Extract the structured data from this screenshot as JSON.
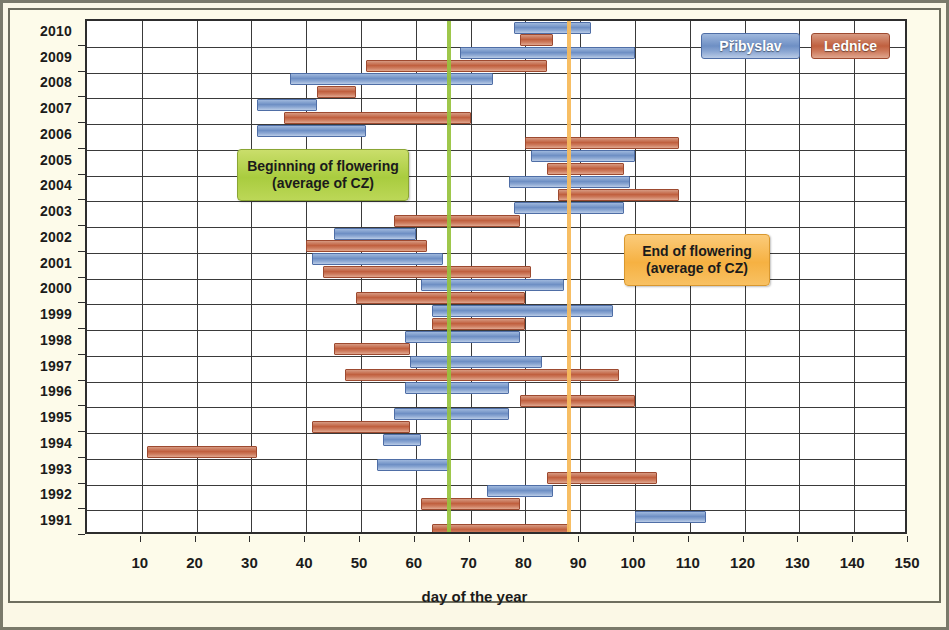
{
  "chart_data": {
    "type": "bar",
    "orientation": "horizontal",
    "subtype": "range-bars",
    "title": "",
    "xlabel": "day of the year",
    "ylabel": "",
    "xlim": [
      0,
      150
    ],
    "ylim_categories": [
      "1991",
      "1992",
      "1993",
      "1994",
      "1995",
      "1996",
      "1997",
      "1998",
      "1999",
      "2000",
      "2001",
      "2002",
      "2003",
      "2004",
      "2005",
      "2006",
      "2007",
      "2008",
      "2009",
      "2010"
    ],
    "grid": true,
    "legend_position": "top-right",
    "x_ticks": [
      10,
      20,
      30,
      40,
      50,
      60,
      70,
      80,
      90,
      100,
      110,
      120,
      130,
      140,
      150
    ],
    "categories": [
      "2010",
      "2009",
      "2008",
      "2007",
      "2006",
      "2005",
      "2004",
      "2003",
      "2002",
      "2001",
      "2000",
      "1999",
      "1998",
      "1997",
      "1996",
      "1995",
      "1994",
      "1993",
      "1992",
      "1991"
    ],
    "series": [
      {
        "name": "Přibyslav",
        "color": "#6e8fc4",
        "ranges": [
          {
            "year": "2010",
            "start": 78,
            "end": 92
          },
          {
            "year": "2009",
            "start": 68,
            "end": 100
          },
          {
            "year": "2008",
            "start": 37,
            "end": 74
          },
          {
            "year": "2007",
            "start": 31,
            "end": 42
          },
          {
            "year": "2006",
            "start": 31,
            "end": 51
          },
          {
            "year": "2005",
            "start": 81,
            "end": 100
          },
          {
            "year": "2004",
            "start": 77,
            "end": 99
          },
          {
            "year": "2003",
            "start": 78,
            "end": 98
          },
          {
            "year": "2002",
            "start": 45,
            "end": 60
          },
          {
            "year": "2001",
            "start": 41,
            "end": 65
          },
          {
            "year": "2000",
            "start": 61,
            "end": 87
          },
          {
            "year": "1999",
            "start": 63,
            "end": 96
          },
          {
            "year": "1998",
            "start": 58,
            "end": 79
          },
          {
            "year": "1997",
            "start": 59,
            "end": 83
          },
          {
            "year": "1996",
            "start": 58,
            "end": 77
          },
          {
            "year": "1995",
            "start": 56,
            "end": 77
          },
          {
            "year": "1994",
            "start": 54,
            "end": 61
          },
          {
            "year": "1993",
            "start": 53,
            "end": 66
          },
          {
            "year": "1992",
            "start": 73,
            "end": 85
          },
          {
            "year": "1991",
            "start": 100,
            "end": 113
          }
        ]
      },
      {
        "name": "Lednice",
        "color": "#c0603f",
        "ranges": [
          {
            "year": "2010",
            "start": 79,
            "end": 85
          },
          {
            "year": "2009",
            "start": 51,
            "end": 84
          },
          {
            "year": "2008",
            "start": 42,
            "end": 49
          },
          {
            "year": "2007",
            "start": 36,
            "end": 70
          },
          {
            "year": "2006",
            "start": 80,
            "end": 108
          },
          {
            "year": "2005",
            "start": 84,
            "end": 98
          },
          {
            "year": "2004",
            "start": 86,
            "end": 108
          },
          {
            "year": "2003",
            "start": 56,
            "end": 79
          },
          {
            "year": "2002",
            "start": 40,
            "end": 62
          },
          {
            "year": "2001",
            "start": 43,
            "end": 81
          },
          {
            "year": "2000",
            "start": 49,
            "end": 80
          },
          {
            "year": "1999",
            "start": 63,
            "end": 80
          },
          {
            "year": "1998",
            "start": 45,
            "end": 59
          },
          {
            "year": "1997",
            "start": 47,
            "end": 97
          },
          {
            "year": "1996",
            "start": 79,
            "end": 100
          },
          {
            "year": "1995",
            "start": 41,
            "end": 59
          },
          {
            "year": "1994",
            "start": 11,
            "end": 31
          },
          {
            "year": "1993",
            "start": 84,
            "end": 104
          },
          {
            "year": "1992",
            "start": 61,
            "end": 79
          },
          {
            "year": "1991",
            "start": 63,
            "end": 88
          }
        ]
      }
    ],
    "reference_lines": [
      {
        "name": "beginning-of-flowering",
        "value": 66,
        "color": "#96c23c",
        "label": "Beginning of flowering",
        "sublabel": "(average of CZ)"
      },
      {
        "name": "end-of-flowering",
        "value": 88,
        "color": "#f7bb5c",
        "label": "End of flowering",
        "sublabel": "(average of CZ)"
      }
    ],
    "annotations": [
      {
        "line1": "Beginning of flowering",
        "line2": "(average of CZ)",
        "color": "#a9cc3f"
      },
      {
        "line1": "End of flowering",
        "line2": "(average of CZ)",
        "color": "#f6b142"
      }
    ]
  },
  "legend": {
    "items": [
      {
        "label": "Přibyslav",
        "color": "#6e8fc4"
      },
      {
        "label": "Lednice",
        "color": "#c0603f"
      }
    ]
  },
  "axis": {
    "x_title": "day of the year"
  }
}
